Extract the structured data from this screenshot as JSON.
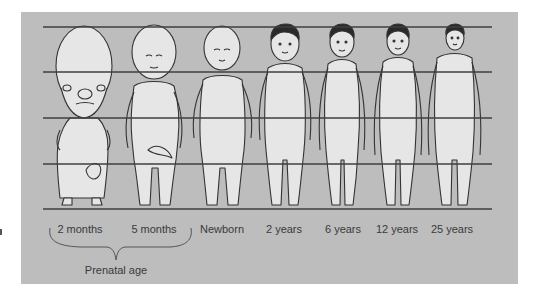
{
  "figure": {
    "colors": {
      "panel_background": "#bdbdbd",
      "guide_lines": "#3f3f3f",
      "figure_fill": "#e6e6e6",
      "figure_outline": "#333333",
      "hair": "#2a2a2a",
      "text": "#3a3a3a"
    },
    "guide_lines_y": [
      27,
      72,
      118,
      164,
      209
    ],
    "stages": [
      {
        "label": "2 months",
        "x": 80
      },
      {
        "label": "5 months",
        "x": 154
      },
      {
        "label": "Newborn",
        "x": 222
      },
      {
        "label": "2 years",
        "x": 284
      },
      {
        "label": "6 years",
        "x": 343
      },
      {
        "label": "12 years",
        "x": 397
      },
      {
        "label": "25 years",
        "x": 452
      }
    ],
    "group": {
      "label": "Prenatal age",
      "spans": [
        "2 months",
        "5 months"
      ]
    }
  }
}
